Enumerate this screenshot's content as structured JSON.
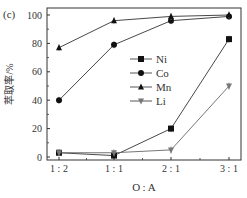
{
  "panel_label": "(c)",
  "chart_data": {
    "type": "line",
    "title": "",
    "xlabel": "O : A",
    "ylabel": "萃取率/%",
    "categories": [
      "1 : 2",
      "1 : 1",
      "2 : 1",
      "3 : 1"
    ],
    "ylim": [
      0,
      100
    ],
    "yticks": [
      0,
      20,
      40,
      60,
      80,
      100
    ],
    "grid": false,
    "legend_position": "center-right",
    "series": [
      {
        "name": "Ni",
        "marker": "square",
        "values": [
          3,
          1,
          20,
          83
        ]
      },
      {
        "name": "Co",
        "marker": "circle",
        "values": [
          40,
          79,
          96,
          99
        ]
      },
      {
        "name": "Mn",
        "marker": "triangle-up",
        "values": [
          77,
          96,
          99,
          100
        ]
      },
      {
        "name": "Li",
        "marker": "triangle-down",
        "values": [
          3,
          3,
          5,
          50
        ]
      }
    ]
  },
  "colors": {
    "axis": "#333333",
    "line": "#333333",
    "marker": "#111111",
    "li_marker": "#777777"
  }
}
